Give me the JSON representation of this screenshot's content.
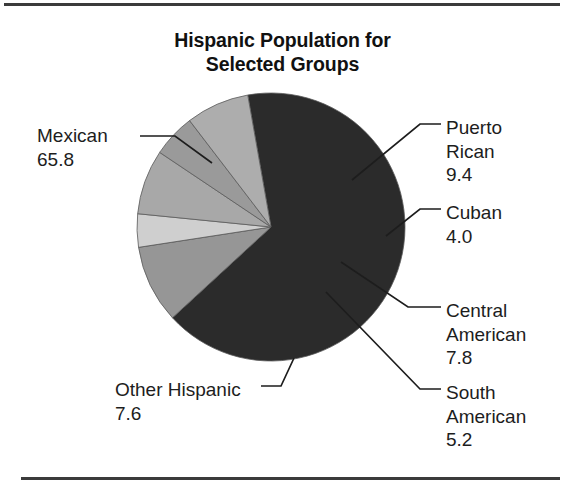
{
  "figure": {
    "title_lines": [
      "Hispanic Population for",
      "Selected Groups"
    ],
    "title_full": "Hispanic Population for Selected Groups",
    "background": "#ffffff",
    "rule_color": "#3b3b3b"
  },
  "chart_data": {
    "type": "pie",
    "title": "Hispanic Population for Selected Groups",
    "xlabel": "",
    "ylabel": "",
    "unit": "percent",
    "total": 99.8,
    "categories": [
      "Mexican",
      "Puerto Rican",
      "Cuban",
      "Central American",
      "South American",
      "Other Hispanic"
    ],
    "values": [
      65.8,
      9.4,
      4.0,
      7.8,
      5.2,
      7.6
    ],
    "labels": [
      {
        "name": "Mexican",
        "value": "65.8",
        "number": 65.8,
        "color": "#2b2b2b",
        "side": "left"
      },
      {
        "name": "Puerto\nRican",
        "value": "9.4",
        "number": 9.4,
        "color": "#969696",
        "side": "right"
      },
      {
        "name": "Cuban",
        "value": "4.0",
        "number": 4.0,
        "color": "#cfcfcf",
        "side": "right"
      },
      {
        "name": "Central\nAmerican",
        "value": "7.8",
        "number": 7.8,
        "color": "#a8a8a8",
        "side": "right"
      },
      {
        "name": "South\nAmerican",
        "value": "5.2",
        "number": 5.2,
        "color": "#9a9a9a",
        "side": "right"
      },
      {
        "name": "Other Hispanic",
        "value": "7.6",
        "number": 7.6,
        "color": "#adadad",
        "side": "left"
      }
    ],
    "legend": "none",
    "grid": false,
    "start_angle_deg": -100,
    "direction": "clockwise",
    "geometry": {
      "cx": 271,
      "cy": 227,
      "r": 134
    }
  },
  "labels": {
    "mexican": {
      "name": "Mexican",
      "value": "65.8"
    },
    "puerto_rican": {
      "name_line1": "Puerto",
      "name_line2": "Rican",
      "value": "9.4"
    },
    "cuban": {
      "name": "Cuban",
      "value": "4.0"
    },
    "central_american": {
      "name_line1": "Central",
      "name_line2": "American",
      "value": "7.8"
    },
    "south_american": {
      "name_line1": "South",
      "name_line2": "American",
      "value": "5.2"
    },
    "other_hispanic": {
      "name": "Other Hispanic",
      "value": "7.6"
    }
  }
}
